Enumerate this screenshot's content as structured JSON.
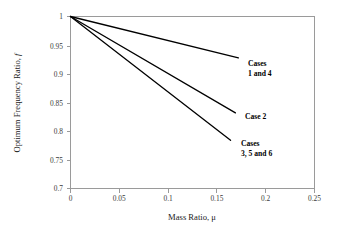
{
  "chart_data": {
    "type": "line",
    "title": "",
    "xlabel": "Mass Ratio, μ",
    "ylabel": "Optimum Frequency Ratio, f",
    "xlim": [
      0,
      0.25
    ],
    "ylim": [
      0.7,
      1
    ],
    "xticks": [
      "0",
      "0.05",
      "0.1",
      "0.15",
      "0.2",
      "0.25"
    ],
    "xtick_values": [
      0,
      0.05,
      0.1,
      0.15,
      0.2,
      0.25
    ],
    "yticks": [
      "0.7",
      "0.75",
      "0.8",
      "0.85",
      "0.9",
      "0.95",
      "1"
    ],
    "ytick_values": [
      0.7,
      0.75,
      0.8,
      0.85,
      0.9,
      0.95,
      1
    ],
    "grid": false,
    "legend": "none",
    "line_color": "#000000",
    "axis_color": "#9a9a9a",
    "series": [
      {
        "name": "Cases 1 and 4",
        "x": [
          0,
          0.172
        ],
        "values": [
          1,
          0.928
        ]
      },
      {
        "name": "Case 2",
        "x": [
          0,
          0.169
        ],
        "values": [
          1,
          0.832
        ]
      },
      {
        "name": "Cases 3, 5 and 6",
        "x": [
          0,
          0.164
        ],
        "values": [
          1,
          0.784
        ]
      }
    ],
    "annotations": [
      {
        "line1": "Cases",
        "line2": "1 and 4",
        "x": 248,
        "y": 63
      },
      {
        "line1": "Case 2",
        "line2": "",
        "x": 245,
        "y": 116
      },
      {
        "line1": "Cases",
        "line2": "3, 5 and 6",
        "x": 241,
        "y": 143
      }
    ]
  },
  "axis_titles": {
    "x_prefix": "Mass Ratio, μ",
    "y_prefix": "Optimum Frequency Ratio, ",
    "y_italic": "f"
  }
}
